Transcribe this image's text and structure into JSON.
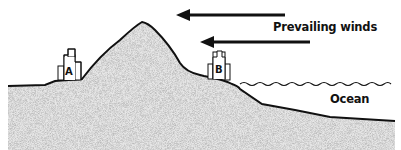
{
  "diagram": {
    "labels": {
      "prevailing_winds": "Prevailing winds",
      "ocean": "Ocean",
      "building_a": "A",
      "building_b": "B"
    },
    "arrows": [
      {
        "name": "upper-wind-arrow",
        "direction": "left"
      },
      {
        "name": "lower-wind-arrow",
        "direction": "left"
      }
    ],
    "colors": {
      "stroke": "#111111",
      "land_fill": "#e6e6e6",
      "background": "#ffffff"
    }
  }
}
